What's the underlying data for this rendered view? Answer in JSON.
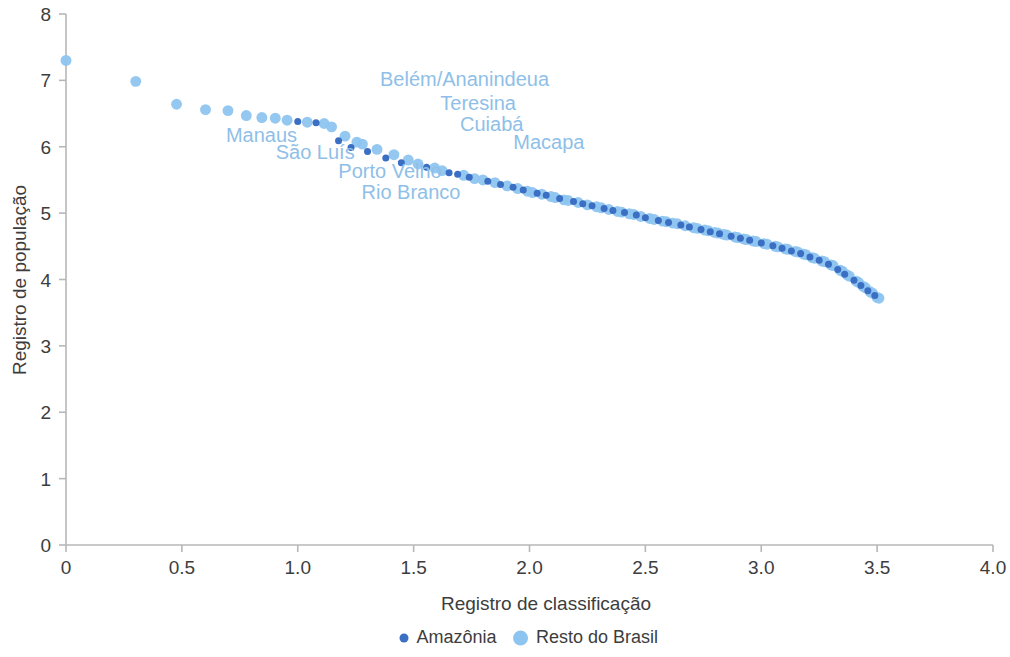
{
  "chart_data": {
    "type": "scatter",
    "title": "",
    "subtitle": "",
    "xlabel": "Registro de classificação",
    "ylabel": "Registro de população",
    "xlim": [
      0,
      4.0
    ],
    "ylim": [
      0,
      8
    ],
    "xticks": [
      "0",
      "0.5",
      "1.0",
      "1.5",
      "2.0",
      "2.5",
      "3.0",
      "3.5",
      "4.0"
    ],
    "xtick_values": [
      0,
      0.5,
      1.0,
      1.5,
      2.0,
      2.5,
      3.0,
      3.5,
      4.0
    ],
    "yticks": [
      "0",
      "1",
      "2",
      "3",
      "4",
      "5",
      "6",
      "7",
      "8"
    ],
    "ytick_values": [
      0,
      1,
      2,
      3,
      4,
      5,
      6,
      7,
      8
    ],
    "grid": false,
    "legend_position": "bottom-center",
    "colors": {
      "amazonia": "#3a6fc4",
      "resto_do_brasil": "#8ec5f0",
      "annotation_text": "#8fbfe8",
      "axis": "#b7b7b7",
      "text": "#3d3d3d"
    },
    "marker_sizes": {
      "amazonia": 7.0,
      "resto_do_brasil": 10.5
    },
    "series": [
      {
        "name": "Amazônia",
        "color": "#3a6fc4",
        "points": [
          [
            1.0,
            6.38
          ],
          [
            1.079,
            6.36
          ],
          [
            1.176,
            6.09
          ],
          [
            1.23,
            5.99
          ],
          [
            1.301,
            5.93
          ],
          [
            1.38,
            5.83
          ],
          [
            1.447,
            5.76
          ],
          [
            1.556,
            5.69
          ],
          [
            1.653,
            5.61
          ],
          [
            1.69,
            5.585
          ],
          [
            1.74,
            5.54
          ],
          [
            1.82,
            5.48
          ],
          [
            1.875,
            5.43
          ],
          [
            1.929,
            5.39
          ],
          [
            1.973,
            5.35
          ],
          [
            2.033,
            5.3
          ],
          [
            2.072,
            5.27
          ],
          [
            2.13,
            5.22
          ],
          [
            2.19,
            5.175
          ],
          [
            2.23,
            5.14
          ],
          [
            2.27,
            5.11
          ],
          [
            2.322,
            5.07
          ],
          [
            2.36,
            5.04
          ],
          [
            2.41,
            5.01
          ],
          [
            2.461,
            4.97
          ],
          [
            2.5,
            4.93
          ],
          [
            2.556,
            4.89
          ],
          [
            2.6,
            4.86
          ],
          [
            2.653,
            4.82
          ],
          [
            2.69,
            4.79
          ],
          [
            2.74,
            4.755
          ],
          [
            2.78,
            4.72
          ],
          [
            2.82,
            4.69
          ],
          [
            2.87,
            4.65
          ],
          [
            2.91,
            4.62
          ],
          [
            2.95,
            4.59
          ],
          [
            3.0,
            4.55
          ],
          [
            3.05,
            4.51
          ],
          [
            3.09,
            4.47
          ],
          [
            3.13,
            4.43
          ],
          [
            3.17,
            4.39
          ],
          [
            3.21,
            4.34
          ],
          [
            3.25,
            4.29
          ],
          [
            3.29,
            4.23
          ],
          [
            3.33,
            4.15
          ],
          [
            3.36,
            4.08
          ],
          [
            3.4,
            3.99
          ],
          [
            3.43,
            3.91
          ],
          [
            3.46,
            3.83
          ],
          [
            3.49,
            3.76
          ]
        ]
      },
      {
        "name": "Resto do Brasil",
        "color": "#8ec5f0",
        "points": [
          [
            0.0,
            7.3
          ],
          [
            0.301,
            6.985
          ],
          [
            0.477,
            6.64
          ],
          [
            0.602,
            6.56
          ],
          [
            0.699,
            6.545
          ],
          [
            0.778,
            6.47
          ],
          [
            0.845,
            6.44
          ],
          [
            0.903,
            6.43
          ],
          [
            0.954,
            6.4
          ],
          [
            1.041,
            6.37
          ],
          [
            1.114,
            6.35
          ],
          [
            1.146,
            6.3
          ],
          [
            1.204,
            6.16
          ],
          [
            1.255,
            6.07
          ],
          [
            1.279,
            6.04
          ],
          [
            1.342,
            5.96
          ],
          [
            1.415,
            5.88
          ],
          [
            1.477,
            5.8
          ],
          [
            1.519,
            5.74
          ],
          [
            1.591,
            5.68
          ],
          [
            1.623,
            5.64
          ],
          [
            1.716,
            5.57
          ],
          [
            1.763,
            5.52
          ],
          [
            1.799,
            5.5
          ],
          [
            1.851,
            5.46
          ],
          [
            1.903,
            5.41
          ],
          [
            1.949,
            5.37
          ],
          [
            1.991,
            5.33
          ],
          [
            2.013,
            5.31
          ],
          [
            2.053,
            5.285
          ],
          [
            2.093,
            5.25
          ],
          [
            2.111,
            5.235
          ],
          [
            2.149,
            5.2
          ],
          [
            2.167,
            5.19
          ],
          [
            2.21,
            5.16
          ],
          [
            2.25,
            5.125
          ],
          [
            2.29,
            5.095
          ],
          [
            2.31,
            5.08
          ],
          [
            2.342,
            5.055
          ],
          [
            2.38,
            5.025
          ],
          [
            2.398,
            5.015
          ],
          [
            2.431,
            4.99
          ],
          [
            2.45,
            4.98
          ],
          [
            2.48,
            4.95
          ],
          [
            2.519,
            4.92
          ],
          [
            2.538,
            4.905
          ],
          [
            2.574,
            4.88
          ],
          [
            2.591,
            4.87
          ],
          [
            2.618,
            4.85
          ],
          [
            2.638,
            4.84
          ],
          [
            2.672,
            4.81
          ],
          [
            2.708,
            4.78
          ],
          [
            2.724,
            4.77
          ],
          [
            2.756,
            4.745
          ],
          [
            2.771,
            4.735
          ],
          [
            2.799,
            4.71
          ],
          [
            2.813,
            4.7
          ],
          [
            2.838,
            4.68
          ],
          [
            2.851,
            4.67
          ],
          [
            2.886,
            4.64
          ],
          [
            2.898,
            4.632
          ],
          [
            2.924,
            4.61
          ],
          [
            2.936,
            4.602
          ],
          [
            2.964,
            4.58
          ],
          [
            2.978,
            4.572
          ],
          [
            3.013,
            4.54
          ],
          [
            3.025,
            4.532
          ],
          [
            3.061,
            4.5
          ],
          [
            3.072,
            4.492
          ],
          [
            3.104,
            4.462
          ],
          [
            3.114,
            4.455
          ],
          [
            3.146,
            4.422
          ],
          [
            3.158,
            4.414
          ],
          [
            3.182,
            4.382
          ],
          [
            3.193,
            4.374
          ],
          [
            3.22,
            4.33
          ],
          [
            3.23,
            4.32
          ],
          [
            3.262,
            4.278
          ],
          [
            3.273,
            4.268
          ],
          [
            3.301,
            4.22
          ],
          [
            3.31,
            4.21
          ],
          [
            3.34,
            4.14
          ],
          [
            3.35,
            4.125
          ],
          [
            3.371,
            4.068
          ],
          [
            3.38,
            4.05
          ],
          [
            3.41,
            3.975
          ],
          [
            3.42,
            3.955
          ],
          [
            3.44,
            3.895
          ],
          [
            3.45,
            3.875
          ],
          [
            3.47,
            3.815
          ],
          [
            3.48,
            3.795
          ],
          [
            3.5,
            3.73
          ],
          [
            3.508,
            3.718
          ]
        ]
      }
    ],
    "annotations": [
      {
        "text": "Belém/Ananindeua",
        "x": 1.355,
        "y": 6.915,
        "anchor": "start"
      },
      {
        "text": "Teresina",
        "x": 1.615,
        "y": 6.56,
        "anchor": "start"
      },
      {
        "text": "Cuiabá",
        "x": 1.7,
        "y": 6.24,
        "anchor": "start"
      },
      {
        "text": "Manaus",
        "x": 0.69,
        "y": 6.07,
        "anchor": "start"
      },
      {
        "text": "São Luís",
        "x": 0.905,
        "y": 5.81,
        "anchor": "start"
      },
      {
        "text": "Macapa",
        "x": 1.93,
        "y": 5.96,
        "anchor": "start"
      },
      {
        "text": "Porto Velho",
        "x": 1.175,
        "y": 5.53,
        "anchor": "start"
      },
      {
        "text": "Rio Branco",
        "x": 1.275,
        "y": 5.21,
        "anchor": "start"
      }
    ],
    "legend": [
      {
        "label": "Amazônia",
        "color": "#3a6fc4",
        "marker_radius": 4.5
      },
      {
        "label": "Resto do Brasil",
        "color": "#8ec5f0",
        "marker_radius": 7.5
      }
    ]
  }
}
